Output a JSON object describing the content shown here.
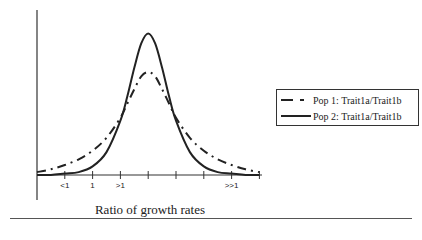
{
  "chart_data": {
    "type": "line",
    "title": "",
    "xlabel": "Ratio of growth rates",
    "ylabel": "Frequency",
    "x_tick_labels": [
      {
        "pos": 1,
        "label": "<1"
      },
      {
        "pos": 2,
        "label": "1"
      },
      {
        "pos": 3,
        "label": ">1"
      },
      {
        "pos": 7,
        "label": ">>1"
      }
    ],
    "x_ticks": [
      1,
      2,
      3,
      4,
      5,
      6,
      7,
      8
    ],
    "xlim": [
      0,
      8
    ],
    "ylim": [
      0,
      1
    ],
    "grid": false,
    "legend_position": "right",
    "x": [
      0,
      0.5,
      1,
      1.5,
      2,
      2.5,
      3,
      3.25,
      3.5,
      3.75,
      4,
      4.25,
      4.5,
      4.75,
      5,
      5.5,
      6,
      6.5,
      7,
      7.5,
      8
    ],
    "series": [
      {
        "name": "Pop 1: Trait1a/Trait1b",
        "style": "dash-dot",
        "values": [
          0.02,
          0.04,
          0.07,
          0.11,
          0.17,
          0.26,
          0.4,
          0.5,
          0.6,
          0.69,
          0.72,
          0.69,
          0.6,
          0.5,
          0.4,
          0.26,
          0.17,
          0.11,
          0.07,
          0.04,
          0.02
        ]
      },
      {
        "name": "Pop 2: Trait1a/Trait1b",
        "style": "solid",
        "values": [
          0.0,
          0.0,
          0.01,
          0.02,
          0.06,
          0.16,
          0.38,
          0.55,
          0.75,
          0.92,
          0.99,
          0.92,
          0.75,
          0.55,
          0.38,
          0.16,
          0.06,
          0.02,
          0.01,
          0.0,
          0.0
        ]
      }
    ]
  },
  "axes": {
    "ylabel": "Frequency",
    "xlabel": "Ratio of growth rates",
    "tick_labels": [
      "<1",
      "1",
      ">1",
      ">>1"
    ]
  },
  "legend": {
    "items": [
      {
        "label": "Pop 1: Trait1a/Trait1b",
        "style": "dash-dot"
      },
      {
        "label": "Pop 2: Trait1a/Trait1b",
        "style": "solid"
      }
    ]
  }
}
